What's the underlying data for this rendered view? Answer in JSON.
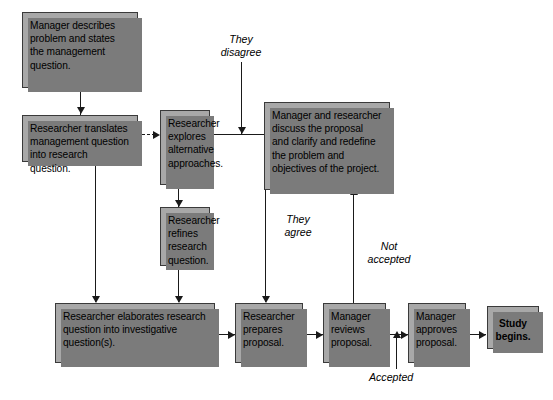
{
  "diagram": {
    "background_color": "#ffffff",
    "node_fill": "#a8a8a8",
    "node_border": "#3a3a3a",
    "node_shadow": "#7b7b7b",
    "line_color": "#1a1a1a",
    "nodes": [
      {
        "id": "manager-describes",
        "label": "Manager describes problem and states the management question."
      },
      {
        "id": "researcher-translates",
        "label": "Researcher translates management question into research question."
      },
      {
        "id": "researcher-explores",
        "label": "Researcher explores alternative approaches."
      },
      {
        "id": "manager-researcher-discuss",
        "label": "Manager and researcher discuss the proposal and clarify and redefine the problem and objectives of the project."
      },
      {
        "id": "researcher-refines",
        "label": "Researcher refines research question."
      },
      {
        "id": "researcher-elaborates",
        "label": "Researcher elaborates research question into investigative question(s)."
      },
      {
        "id": "researcher-prepares",
        "label": "Researcher prepares proposal."
      },
      {
        "id": "manager-reviews",
        "label": "Manager reviews proposal."
      },
      {
        "id": "manager-approves",
        "label": "Manager approves proposal."
      },
      {
        "id": "study-begins",
        "label": "Study begins."
      }
    ],
    "edge_labels": [
      {
        "id": "they-disagree",
        "label": "They\ndisagree"
      },
      {
        "id": "they-agree",
        "label": "They\nagree"
      },
      {
        "id": "not-accepted",
        "label": "Not\naccepted"
      },
      {
        "id": "accepted",
        "label": "Accepted"
      }
    ]
  }
}
